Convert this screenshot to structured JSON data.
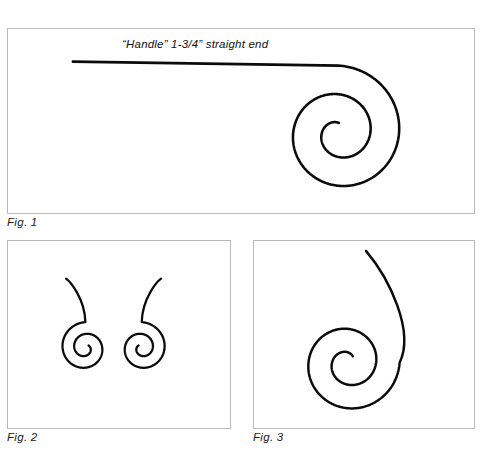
{
  "sheet": {
    "background_color": "#ffffff",
    "ink_color": "#0b0b0b",
    "panel_border_color": "#b9b9bb",
    "title": "Spiral forming diagrams"
  },
  "figures": [
    {
      "id": "fig1",
      "caption": "Fig. 1",
      "annotation": "“Handle” 1-3/4” straight end",
      "description": "Single clockwise spiral with a long straight handle entering from the left",
      "shape": {
        "type": "spiral-with-straight-handle",
        "handle_start_x": 71,
        "handle_y": 61,
        "spiral_center_x": 340,
        "spiral_center_y": 133,
        "outer_radius": 68,
        "inner_radius": 10,
        "turns": 2.0,
        "stroke_width": 2.6
      }
    },
    {
      "id": "fig2",
      "caption": "Fig. 2",
      "annotation": "",
      "description": "Two mirrored spirals with tails sweeping upward and inward",
      "shape": {
        "type": "mirrored-spiral-pair",
        "left_center_x": 85,
        "left_center_y": 348,
        "right_center_x": 142,
        "right_center_y": 348,
        "outer_radius": 26,
        "inner_radius": 4,
        "turns": 1.85,
        "tail_top_y": 278,
        "stroke_width": 2.3
      }
    },
    {
      "id": "fig3",
      "caption": "Fig. 3",
      "annotation": "",
      "description": "Single spiral with an S-curved tail rising upward",
      "shape": {
        "type": "spiral-with-curved-tail",
        "spiral_center_x": 348,
        "spiral_center_y": 363,
        "outer_radius": 52,
        "inner_radius": 8,
        "turns": 1.85,
        "tail_tip_x": 366,
        "tail_tip_y": 250,
        "stroke_width": 2.5
      }
    }
  ]
}
